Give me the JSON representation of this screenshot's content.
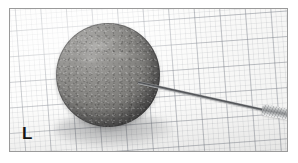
{
  "figure": {
    "type": "photograph",
    "orientation_label": "L",
    "background_description": "millimetre graph paper grid, slightly rotated",
    "colors": {
      "specimen_light": "#a9a8a6",
      "specimen_mid": "#807f7c",
      "specimen_dark": "#424140",
      "paper": "#fdfdfc",
      "grid_line_major": "#787d87",
      "grid_line_minor": "#8c919b",
      "frame_border": "#9a9a9a",
      "label_text": "#161616",
      "probe_metal": "#8f9193"
    }
  },
  "elements": {
    "frame_name": "photo border",
    "grid_name": "graph paper background",
    "specimen_name": "gray sphere specimen",
    "shadow_name": "cast shadow",
    "probe_needle_name": "probe needle shaft",
    "probe_handle_name": "probe handle"
  }
}
